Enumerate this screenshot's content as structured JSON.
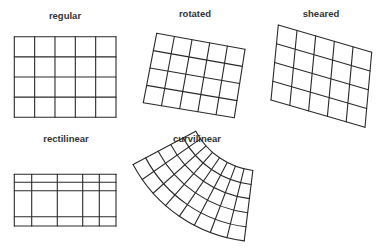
{
  "diagram": {
    "stroke_color": "#2a2a2a",
    "label_color": "#333333",
    "panels": [
      {
        "id": "regular",
        "label": "regular",
        "label_pos": [
          65,
          19
        ],
        "type": "quad",
        "cols": 5,
        "rows": 4,
        "corners": {
          "tl": [
            14.3,
            36.7
          ],
          "tr": [
            116,
            36.7
          ],
          "bl": [
            14.3,
            117.3
          ],
          "br": [
            116,
            117.3
          ]
        }
      },
      {
        "id": "rotated",
        "label": "rotated",
        "label_pos": [
          195,
          17
        ],
        "type": "quad",
        "cols": 5,
        "rows": 4,
        "corners": {
          "tl": [
            156.7,
            33.3
          ],
          "tr": [
            245,
            49.3
          ],
          "bl": [
            143.3,
            102.7
          ],
          "br": [
            234.3,
            117.7
          ]
        }
      },
      {
        "id": "sheared",
        "label": "sheared",
        "label_pos": [
          321,
          17
        ],
        "type": "quad",
        "cols": 5,
        "rows": 4,
        "corners": {
          "tl": [
            278.3,
            25
          ],
          "tr": [
            371.7,
            52.3
          ],
          "bl": [
            271,
            100
          ],
          "br": [
            365,
            127.3
          ]
        }
      },
      {
        "id": "rectilinear",
        "label": "rectilinear",
        "label_pos": [
          66,
          142
        ],
        "type": "rectilinear",
        "x_lines": [
          14.3,
          31.7,
          57.3,
          82.7,
          99.3,
          116
        ],
        "y_lines": [
          174.3,
          182.3,
          190.7,
          216.7,
          226
        ]
      },
      {
        "id": "curvilinear",
        "label": "curvilinear",
        "label_pos": [
          197,
          142
        ],
        "type": "polar",
        "cols": 8,
        "rows": 5,
        "center": [
          262,
          96
        ],
        "radius_inner": 75,
        "radius_outer": 146,
        "angle_start_deg": 97,
        "angle_end_deg": 152
      }
    ]
  }
}
